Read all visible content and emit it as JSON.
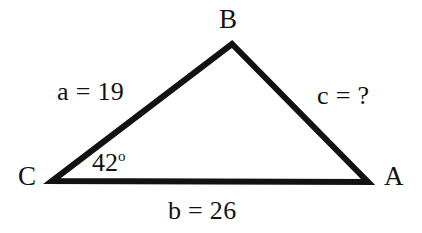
{
  "figure": {
    "type": "triangle-diagram",
    "background_color": "#ffffff",
    "stroke_color": "#121212",
    "text_color": "#121212",
    "stroke_width": 6
  },
  "vertices": {
    "a": {
      "label": "A",
      "x": 368,
      "y": 182
    },
    "b": {
      "label": "B",
      "x": 232,
      "y": 44
    },
    "c": {
      "label": "C",
      "x": 52,
      "y": 181
    }
  },
  "sides": {
    "a": {
      "label": "a = 19",
      "name": "a",
      "value": "19",
      "opposite_vertex": "A"
    },
    "b": {
      "label": "b = 26",
      "name": "b",
      "value": "26",
      "opposite_vertex": "B"
    },
    "c": {
      "label": "c = ?",
      "name": "c",
      "value": "?",
      "opposite_vertex": "C"
    }
  },
  "angles": {
    "c": {
      "value": "42",
      "degree_symbol": "o",
      "label": "42"
    }
  }
}
